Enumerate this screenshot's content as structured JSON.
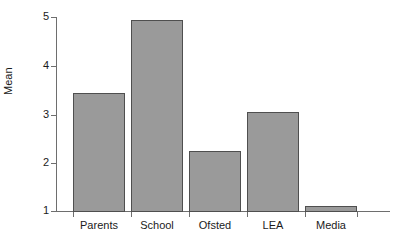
{
  "chart_data": {
    "type": "bar",
    "title": "",
    "xlabel": "",
    "ylabel": "Mean",
    "categories": [
      "Parents",
      "School",
      "Ofsted",
      "LEA",
      "Media"
    ],
    "values": [
      3.44,
      4.94,
      2.24,
      3.04,
      1.1
    ],
    "ylim": [
      1,
      5
    ],
    "yticks": [
      1,
      2,
      3,
      4,
      5
    ],
    "ytick_labels": [
      "1",
      "2",
      "3",
      "4",
      "5"
    ],
    "grid": false,
    "legend": null,
    "bar_color": "#9a9a9a",
    "bar_edge_color": "#4f4f4f",
    "axis_color": "#6e6e6e",
    "background_color": "#ffffff",
    "text_color": "#1b1b1b"
  }
}
